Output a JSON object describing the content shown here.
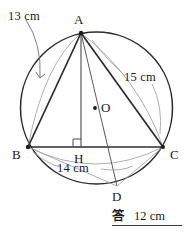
{
  "figure": {
    "circle": {
      "cx": 96.5,
      "cy": 108,
      "r": 76,
      "stroke": "#2b2b2b"
    },
    "points": [
      {
        "id": "A",
        "label": "A",
        "x": 81,
        "y": 33,
        "label_x": 74,
        "label_y": 13,
        "dot": true
      },
      {
        "id": "B",
        "label": "B",
        "x": 28,
        "y": 147,
        "label_x": 12,
        "label_y": 148,
        "dot": true
      },
      {
        "id": "C",
        "label": "C",
        "x": 163,
        "y": 147,
        "label_x": 170,
        "label_y": 148,
        "dot": true
      },
      {
        "id": "H",
        "label": "H",
        "x": 81,
        "y": 147,
        "label_x": 74,
        "label_y": 152,
        "dot": false
      },
      {
        "id": "O",
        "label": "O",
        "x": 95,
        "y": 108,
        "label_x": 101,
        "label_y": 101,
        "dot": true
      },
      {
        "id": "D",
        "label": "D",
        "x": 117,
        "y": 186,
        "label_x": 112,
        "label_y": 190,
        "dot": false
      }
    ],
    "measurements": [
      {
        "id": "side-ab",
        "text": "13 cm",
        "x": 8,
        "y": 10,
        "refers_to": "AB"
      },
      {
        "id": "side-ac",
        "text": "15 cm",
        "x": 124,
        "y": 71,
        "refers_to": "AC"
      },
      {
        "id": "side-bc",
        "text": "14 cm",
        "x": 57,
        "y": 162,
        "refers_to": "BC"
      }
    ],
    "colors": {
      "outline": "#2b2b2b",
      "chord": "#3a3a3a",
      "thin_guide": "#8e8e8e",
      "leader": "#6f6f6f",
      "text": "#1a1a1a"
    }
  },
  "answer": {
    "label": "答",
    "value": "12 cm"
  }
}
